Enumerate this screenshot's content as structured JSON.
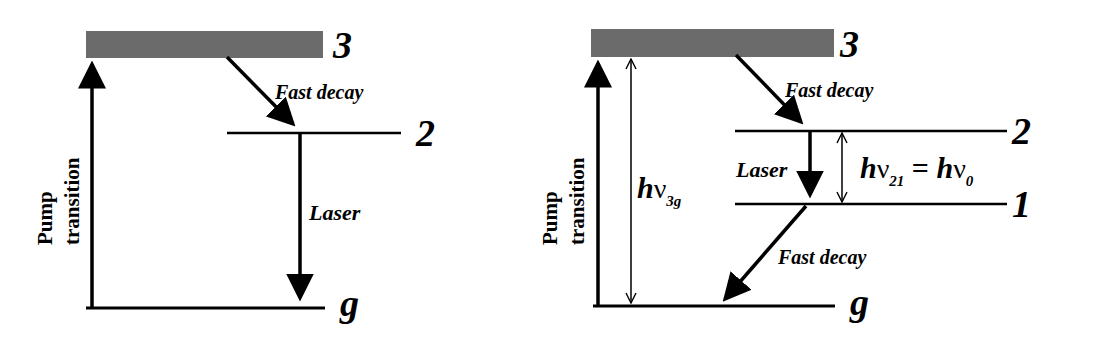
{
  "diagrams": [
    {
      "name": "three-level-laser-left",
      "levels": {
        "top": "3",
        "upper": "2",
        "ground": "g"
      },
      "labels": {
        "pump_line1": "Pump",
        "pump_line2": "transition",
        "fast_decay": "Fast decay",
        "laser": "Laser"
      }
    },
    {
      "name": "four-level-laser-right",
      "levels": {
        "top": "3",
        "upper": "2",
        "lower": "1",
        "ground": "g"
      },
      "labels": {
        "pump_line1": "Pump",
        "pump_line2": "transition",
        "fast_decay_upper": "Fast decay",
        "fast_decay_lower": "Fast decay",
        "laser": "Laser",
        "h_3g": "h",
        "nu_3g": "ν",
        "sub_3g": "3g",
        "h_21": "h",
        "nu_21": "ν",
        "sub_21": "21",
        "equals": " = ",
        "h_0": "h",
        "nu_0": "ν",
        "sub_0": "0"
      }
    }
  ],
  "colors": {
    "band": "#6b6b6b",
    "line": "#000000"
  }
}
